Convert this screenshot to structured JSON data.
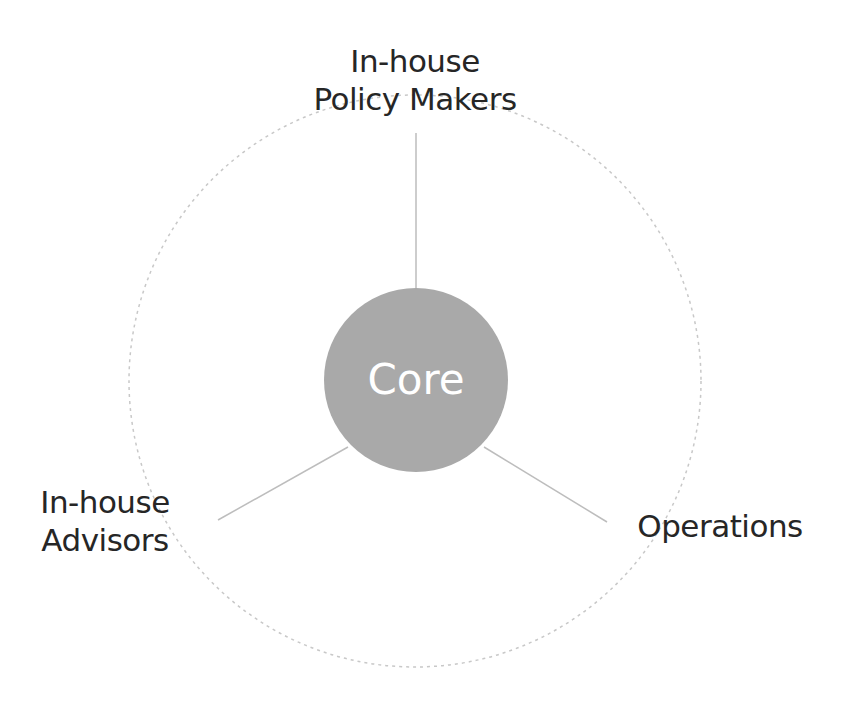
{
  "diagram": {
    "type": "hub-and-spoke",
    "center": {
      "label": "Core",
      "fill": "#a9a9a9",
      "text_color": "#ffffff"
    },
    "outer_ring": {
      "style": "dotted",
      "color": "#c8c8c8"
    },
    "spoke_color": "#bdbdbd",
    "nodes": [
      {
        "id": "top",
        "line1": "In-house",
        "line2": "Policy Makers"
      },
      {
        "id": "bottom-left",
        "line1": "In-house",
        "line2": "Advisors"
      },
      {
        "id": "bottom-right",
        "line1": "Operations"
      }
    ]
  }
}
